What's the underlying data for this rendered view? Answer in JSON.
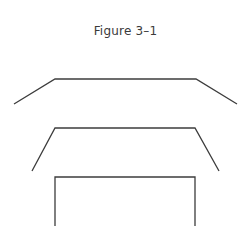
{
  "figure": {
    "title": "Figure 3–1",
    "stroke_color": "#3c3c3c",
    "shapes": [
      {
        "name": "wide-flared-shape",
        "points": "14,104 55,79 196,79 237,104"
      },
      {
        "name": "steep-flared-shape",
        "points": "32,171 55,128 195,128 219,171"
      },
      {
        "name": "rectangular-bracket-shape",
        "points": "55,226 55,177 195,177 195,226"
      }
    ]
  }
}
